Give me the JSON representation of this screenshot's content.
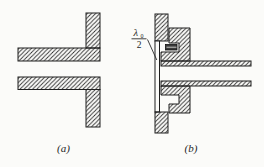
{
  "figure": {
    "captions": {
      "a": "(a)",
      "b": "(b)"
    },
    "annotation": {
      "lambda": "λ",
      "lambda_subscript": "0",
      "denominator": "2"
    }
  },
  "colors": {
    "ink": "#2b2b2b",
    "paper": "#fbfbf9",
    "gasket_fill": "#3a3a3a"
  }
}
